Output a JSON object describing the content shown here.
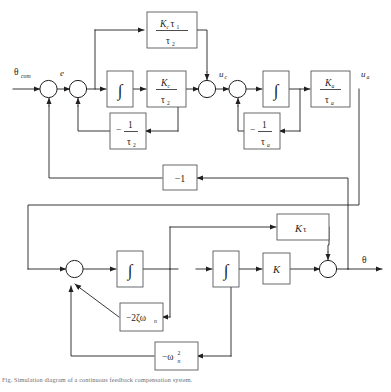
{
  "figure": {
    "type": "control-system-block-diagram",
    "caption": "Fig. Simulation diagram of a continuous feedback compensation system.",
    "signals": {
      "input": "θ",
      "input_sub": "com",
      "error": "e",
      "u_c": "u",
      "u_c_sub": "c",
      "u_a": "u",
      "u_a_sub": "a",
      "output": "θ"
    },
    "blocks": [
      {
        "id": "kc-tau1-tau2",
        "kind": "fraction",
        "num": "Kcτ₁",
        "num_main": "K",
        "num_sub": "c",
        "num_tail": "τ",
        "num_tail_sub": "1",
        "den_main": "τ",
        "den_sub": "2",
        "label": "Kcτ1/τ2"
      },
      {
        "id": "integrator-1",
        "kind": "integrator",
        "label": "∫"
      },
      {
        "id": "kc-tau2",
        "kind": "fraction",
        "num_main": "K",
        "num_sub": "c",
        "den_main": "τ",
        "den_sub": "2",
        "label": "Kc/τ2"
      },
      {
        "id": "neg-inv-tau2",
        "kind": "neg-fraction",
        "sign": "−",
        "num_main": "1",
        "den_main": "τ",
        "den_sub": "2",
        "label": "−1/τ2"
      },
      {
        "id": "integrator-2",
        "kind": "integrator",
        "label": "∫"
      },
      {
        "id": "ka-taua",
        "kind": "fraction",
        "num_main": "K",
        "num_sub": "a",
        "den_main": "τ",
        "den_sub": "a",
        "label": "Ka/τa"
      },
      {
        "id": "neg-inv-taua",
        "kind": "neg-fraction",
        "sign": "−",
        "num_main": "1",
        "den_main": "τ",
        "den_sub": "a",
        "label": "−1/τa"
      },
      {
        "id": "minus-one",
        "kind": "plain",
        "label": "−1"
      },
      {
        "id": "k-tau",
        "kind": "plain-italic",
        "main": "K",
        "sub_tail": "τ",
        "label": "Kτ"
      },
      {
        "id": "integrator-3",
        "kind": "integrator",
        "label": "∫"
      },
      {
        "id": "integrator-4",
        "kind": "integrator",
        "label": "∫"
      },
      {
        "id": "gain-k",
        "kind": "plain-italic",
        "main": "K",
        "label": "K"
      },
      {
        "id": "neg-2-zeta-omega-n",
        "kind": "composite",
        "main": "−2ζω",
        "sub": "n",
        "label": "−2ζωn"
      },
      {
        "id": "neg-omega-n-squared",
        "kind": "composite-sup",
        "main": "−ω",
        "sub": "n",
        "sup": "2",
        "label": "−ωn²"
      }
    ],
    "summing_junctions": [
      {
        "id": "sum-1"
      },
      {
        "id": "sum-2"
      },
      {
        "id": "sum-3"
      },
      {
        "id": "sum-4"
      },
      {
        "id": "sum-5"
      },
      {
        "id": "sum-6"
      }
    ],
    "colors": {
      "line": "#231f20",
      "block_stroke": "#58595b",
      "background": "#ffffff",
      "caption": "#6d6e71"
    }
  }
}
